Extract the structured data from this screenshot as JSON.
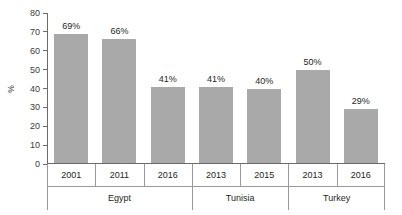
{
  "chart_data": {
    "type": "bar",
    "title": "",
    "xlabel": "",
    "ylabel": "%",
    "ylim": [
      0,
      80
    ],
    "ytick_values": [
      0,
      10,
      20,
      30,
      40,
      50,
      60,
      70,
      80
    ],
    "ytick_labels": [
      "0",
      "10",
      "20",
      "30",
      "40",
      "50",
      "60",
      "70",
      "80"
    ],
    "grid": false,
    "legend": "none",
    "categories": [
      "2001",
      "2011",
      "2016",
      "2013",
      "2015",
      "2013",
      "2016"
    ],
    "values": [
      69,
      66,
      41,
      41,
      40,
      50,
      29
    ],
    "data_labels": [
      "69%",
      "66%",
      "41%",
      "41%",
      "40%",
      "50%",
      "29%"
    ],
    "bar_color": "#a9a9a9",
    "groups": [
      {
        "label": "Egypt",
        "span": 3
      },
      {
        "label": "Tunisia",
        "span": 2
      },
      {
        "label": "Turkey",
        "span": 2
      }
    ],
    "bars": [
      {
        "category": "2001",
        "group": "Egypt",
        "value": 69,
        "label": "69%"
      },
      {
        "category": "2011",
        "group": "Egypt",
        "value": 66,
        "label": "66%"
      },
      {
        "category": "2016",
        "group": "Egypt",
        "value": 41,
        "label": "41%"
      },
      {
        "category": "2013",
        "group": "Tunisia",
        "value": 41,
        "label": "41%"
      },
      {
        "category": "2015",
        "group": "Tunisia",
        "value": 40,
        "label": "40%"
      },
      {
        "category": "2013",
        "group": "Turkey",
        "value": 50,
        "label": "50%"
      },
      {
        "category": "2016",
        "group": "Turkey",
        "value": 29,
        "label": "29%"
      }
    ]
  }
}
